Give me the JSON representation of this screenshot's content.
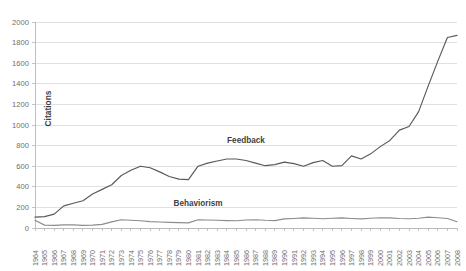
{
  "chart_data": {
    "type": "line",
    "title": "",
    "xlabel": "",
    "ylabel": "Citations",
    "ylim": [
      0,
      2000
    ],
    "ytick_step": 200,
    "yticks": [
      0,
      200,
      400,
      600,
      800,
      1000,
      1200,
      1400,
      1600,
      1800,
      2000
    ],
    "grid": true,
    "legend_position": "inline-annotation",
    "categories": [
      "1964",
      "1965",
      "1966",
      "1967",
      "1968",
      "1969",
      "1970",
      "1971",
      "1972",
      "1973",
      "1974",
      "1975",
      "1976",
      "1977",
      "1978",
      "1979",
      "1980",
      "1981",
      "1982",
      "1983",
      "1984",
      "1985",
      "1986",
      "1987",
      "1988",
      "1989",
      "1990",
      "1991",
      "1992",
      "1993",
      "1994",
      "1995",
      "1996",
      "1997",
      "1998",
      "1999",
      "2000",
      "2001",
      "2002",
      "2003",
      "2004",
      "2005",
      "2006",
      "2007",
      "2008"
    ],
    "series": [
      {
        "name": "Feedback",
        "color": "#595959",
        "label_x_category": "1986",
        "label_y_value": 830,
        "values": [
          105,
          110,
          135,
          215,
          240,
          265,
          330,
          375,
          420,
          510,
          560,
          600,
          585,
          545,
          500,
          475,
          470,
          600,
          630,
          650,
          670,
          670,
          655,
          630,
          605,
          615,
          640,
          625,
          600,
          635,
          655,
          600,
          605,
          700,
          670,
          720,
          790,
          850,
          950,
          985,
          1130,
          1380,
          1620,
          1850,
          1870
        ]
      },
      {
        "name": "Behaviorism",
        "color": "#8c8c8c",
        "label_x_category": "1981",
        "label_y_value": 210,
        "values": [
          75,
          28,
          25,
          30,
          30,
          25,
          28,
          35,
          60,
          80,
          75,
          70,
          62,
          58,
          55,
          52,
          50,
          80,
          78,
          75,
          72,
          70,
          78,
          80,
          75,
          72,
          88,
          92,
          98,
          95,
          90,
          95,
          98,
          92,
          88,
          95,
          100,
          98,
          92,
          90,
          95,
          105,
          100,
          92,
          60
        ]
      }
    ]
  },
  "plot": {
    "left": 35,
    "top": 22,
    "right": 457,
    "bottom": 228
  },
  "colors": {
    "grid": "#d9d9d9",
    "axis": "#b7b7b7",
    "tick_text": "#6e6e6e",
    "label_text": "#3f3f3f",
    "background": "#ffffff"
  }
}
